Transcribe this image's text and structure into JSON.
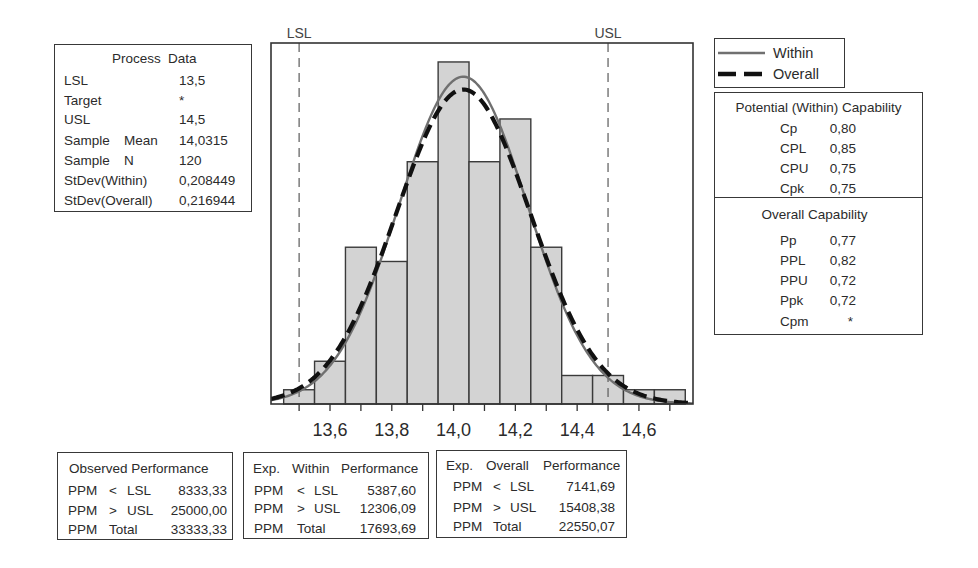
{
  "process_data": {
    "title_left": "Process",
    "title_right": "Data",
    "rows": [
      {
        "label": "LSL",
        "label2": "",
        "value": "13,5"
      },
      {
        "label": "Target",
        "label2": "",
        "value": "*"
      },
      {
        "label": "USL",
        "label2": "",
        "value": "14,5"
      },
      {
        "label": "Sample",
        "label2": "Mean",
        "value": "14,0315"
      },
      {
        "label": "Sample",
        "label2": "N",
        "value": "120"
      },
      {
        "label": "StDev(Within)",
        "label2": "",
        "value": "0,208449"
      },
      {
        "label": "StDev(Overall)",
        "label2": "",
        "value": "0,216944"
      }
    ]
  },
  "legend": {
    "items": [
      {
        "label": "Within",
        "style": "solid",
        "color": "#707070"
      },
      {
        "label": "Overall",
        "style": "dashed",
        "color": "#111111"
      }
    ]
  },
  "potential_capability": {
    "title": "Potential (Within) Capability",
    "rows": [
      {
        "label": "Cp",
        "value": "0,80"
      },
      {
        "label": "CPL",
        "value": "0,85"
      },
      {
        "label": "CPU",
        "value": "0,75"
      },
      {
        "label": "Cpk",
        "value": "0,75"
      }
    ]
  },
  "overall_capability": {
    "title": "Overall Capability",
    "rows": [
      {
        "label": "Pp",
        "value": "0,77"
      },
      {
        "label": "PPL",
        "value": "0,82"
      },
      {
        "label": "PPU",
        "value": "0,72"
      },
      {
        "label": "Ppk",
        "value": "0,72"
      },
      {
        "label": "Cpm",
        "value": "*"
      }
    ]
  },
  "observed_performance": {
    "title": "Observed Performance",
    "rows": [
      {
        "unit": "PPM",
        "op": "<",
        "limit": "LSL",
        "value": "8333,33"
      },
      {
        "unit": "PPM",
        "op": ">",
        "limit": "USL",
        "value": "25000,00"
      },
      {
        "unit": "PPM",
        "op": "Total",
        "limit": "",
        "value": "33333,33"
      }
    ]
  },
  "exp_within_performance": {
    "title_parts": [
      "Exp.",
      "Within",
      "Performance"
    ],
    "rows": [
      {
        "unit": "PPM",
        "op": "<",
        "limit": "LSL",
        "value": "5387,60"
      },
      {
        "unit": "PPM",
        "op": ">",
        "limit": "USL",
        "value": "12306,09"
      },
      {
        "unit": "PPM",
        "op": "Total",
        "limit": "",
        "value": "17693,69"
      }
    ]
  },
  "exp_overall_performance": {
    "title_parts": [
      "Exp.",
      "Overall",
      "Performance"
    ],
    "rows": [
      {
        "unit": "PPM",
        "op": "<",
        "limit": "LSL",
        "value": "7141,69"
      },
      {
        "unit": "PPM",
        "op": ">",
        "limit": "USL",
        "value": "15408,38"
      },
      {
        "unit": "PPM",
        "op": "Total",
        "limit": "",
        "value": "22550,07"
      }
    ]
  },
  "chart_data": {
    "type": "bar",
    "title": "",
    "xlabel": "",
    "ylabel": "",
    "grid": false,
    "n": 120,
    "bin_width": 0.1,
    "categories": [
      13.5,
      13.6,
      13.7,
      13.8,
      13.9,
      14.0,
      14.1,
      14.2,
      14.3,
      14.4,
      14.5,
      14.6,
      14.7
    ],
    "values": [
      1,
      3,
      11,
      10,
      17,
      24,
      17,
      20,
      11,
      2,
      2,
      1,
      1
    ],
    "xlim": [
      13.409,
      14.775
    ],
    "ylim": [
      0,
      25.33
    ],
    "x_ticks": [
      13.5,
      13.6,
      13.7,
      13.8,
      13.9,
      14.0,
      14.1,
      14.2,
      14.3,
      14.4,
      14.5,
      14.6,
      14.7
    ],
    "x_tick_labels": [
      {
        "x": 13.6,
        "label": "13,6"
      },
      {
        "x": 13.8,
        "label": "13,8"
      },
      {
        "x": 14.0,
        "label": "14,0"
      },
      {
        "x": 14.2,
        "label": "14,2"
      },
      {
        "x": 14.4,
        "label": "14,4"
      },
      {
        "x": 14.6,
        "label": "14,6"
      }
    ],
    "reference_lines": [
      {
        "label": "LSL",
        "x": 13.5
      },
      {
        "label": "USL",
        "x": 14.5
      }
    ],
    "series": [
      {
        "name": "Within",
        "type": "line",
        "distribution": "normal",
        "mean": 14.0315,
        "stdev": 0.208449,
        "style": "solid"
      },
      {
        "name": "Overall",
        "type": "line",
        "distribution": "normal",
        "mean": 14.0315,
        "stdev": 0.216944,
        "style": "dashed"
      }
    ],
    "legend": {
      "entries": [
        "Within",
        "Overall"
      ],
      "position": "top-right"
    },
    "colors": {
      "bar_fill": "#d3d3d3",
      "bar_stroke": "#3a3a3a",
      "within": "#707070",
      "overall": "#111111",
      "spec_line": "#5a5a5a"
    }
  }
}
